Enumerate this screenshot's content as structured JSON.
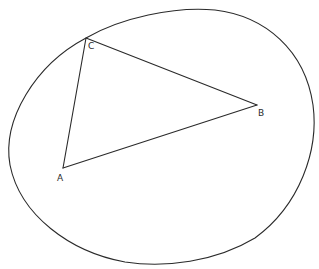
{
  "diagram": {
    "shapes": {
      "outer_curve": "closed oval",
      "triangle": "triangle ABC"
    },
    "vertices": {
      "A": {
        "label": "A"
      },
      "B": {
        "label": "B"
      },
      "C": {
        "label": "C"
      }
    },
    "edges": [
      {
        "from": "A",
        "to": "B"
      },
      {
        "from": "B",
        "to": "C"
      },
      {
        "from": "C",
        "to": "A"
      }
    ],
    "colors": {
      "stroke": "#2a2a2a",
      "background": "#ffffff"
    }
  }
}
